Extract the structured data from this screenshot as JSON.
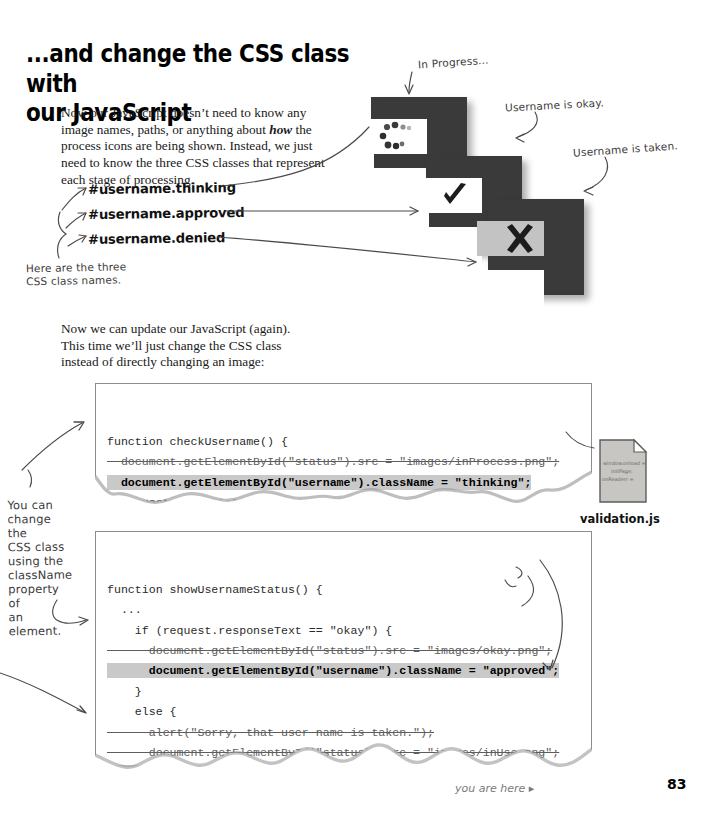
{
  "heading": {
    "line1": "...and change the CSS class with",
    "line2": "our JavaScript"
  },
  "paragraphs": {
    "intro_a": "Now our JavaScript doesn’t need to know any image names, paths, or anything about ",
    "intro_em": "how",
    "intro_b": " the process icons are being shown. Instead, we just need to know the three CSS classes that represent each stage of processing.",
    "update": "Now we can update our JavaScript (again). This time we’ll just change the CSS class instead of directly changing an image:"
  },
  "css_classes": [
    "#username.thinking",
    "#username.approved",
    "#username.denied"
  ],
  "annotations": {
    "here_are_three": "Here are the three\nCSS class names.",
    "in_progress": "In Progress...",
    "username_okay": "Username is okay.",
    "username_taken": "Username is taken.",
    "you_can_change": "You can\nchange the\nCSS class\nusing the\nclassName\nproperty of\nan element.",
    "remember_remove": "Remember to remove the\nlines that changed the\nimage directly."
  },
  "icons": {
    "thinking": {
      "name": "in-progress-dots-icon",
      "glyph": "•••",
      "fill": "#3a3a3a"
    },
    "approved": {
      "name": "checkmark-icon",
      "glyph": "✔",
      "fill": "#3a3a3a"
    },
    "denied": {
      "name": "x-cross-icon",
      "glyph": "✕",
      "fill": "#3a3a3a"
    }
  },
  "code_block_1": {
    "lines": [
      {
        "text": "function checkUsername() {",
        "style": "plain"
      },
      {
        "text": "  document.getElementById(\"status\").src = \"images/inProcess.png\";",
        "style": "strike"
      },
      {
        "text": "  document.getElementById(\"username\").className = \"thinking\";",
        "style": "highlight"
      },
      {
        "text": "  request = createRequest();",
        "style": "plain"
      },
      {
        "text": "  ...",
        "style": "plain"
      }
    ]
  },
  "code_block_2": {
    "lines": [
      {
        "text": "function showUsernameStatus() {",
        "style": "plain"
      },
      {
        "text": "  ...",
        "style": "plain"
      },
      {
        "text": "    if (request.responseText == \"okay\") {",
        "style": "plain"
      },
      {
        "text": "      document.getElementById(\"status\").src = \"images/okay.png\";",
        "style": "strike"
      },
      {
        "text": "      document.getElementById(\"username\").className = \"approved\";",
        "style": "highlight"
      },
      {
        "text": "    }",
        "style": "plain"
      },
      {
        "text": "    else {",
        "style": "plain"
      },
      {
        "text": "      alert(\"Sorry, that user name is taken.\");",
        "style": "strike"
      },
      {
        "text": "      document.getElementById(\"status\").src = \"images/inUse.png\";",
        "style": "strike"
      },
      {
        "text": "      document.getElementById(\"username\").className = \"denied\";",
        "style": "highlight"
      },
      {
        "text": "    }",
        "style": "plain"
      },
      {
        "text": "  ...",
        "style": "plain"
      },
      {
        "text": "}",
        "style": "plain"
      }
    ]
  },
  "file_card": {
    "label": "validation.js",
    "scribble": [
      "window.onload =",
      "initPage;",
      "onReaderr ="
    ]
  },
  "footer": {
    "you_are_here": "you are here ▸",
    "page_number": "83"
  },
  "colors": {
    "ink": "#3a3a3a",
    "highlight": "#c9c9c9",
    "box_border": "#8d8d8d",
    "paper": "#ffffff"
  }
}
